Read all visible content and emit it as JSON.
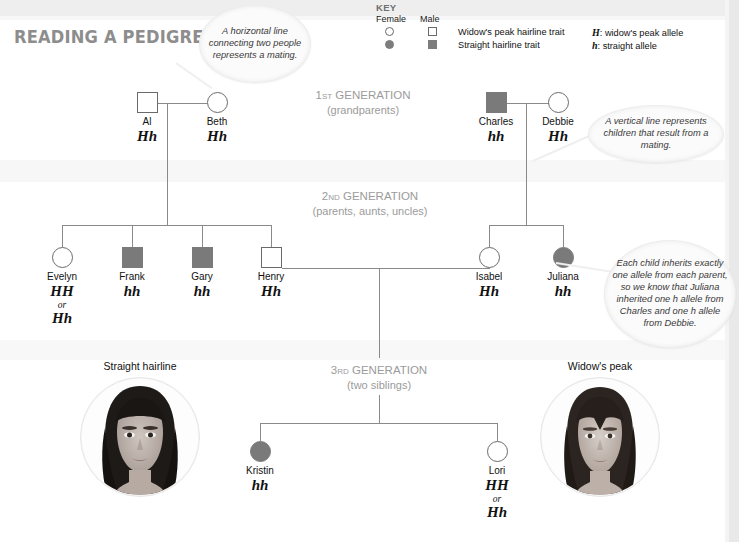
{
  "title": "READING A PEDIGREE",
  "key": {
    "heading": "KEY",
    "col_female": "Female",
    "col_male": "Male",
    "trait_widows_peak": "Widow's peak hairline trait",
    "trait_straight": "Straight hairline trait",
    "allele_H_letter": "H",
    "allele_H_text": ": widow's peak allele",
    "allele_h_letter": "h",
    "allele_h_text": ": straight allele",
    "symbols": {
      "female_open": "open-circle-icon",
      "male_open": "open-square-icon",
      "female_filled": "filled-circle-icon",
      "male_filled": "filled-square-icon"
    }
  },
  "generations": [
    {
      "ordinal": "1",
      "suffix": "ST",
      "word": "GENERATION",
      "sub": "(grandparents)"
    },
    {
      "ordinal": "2",
      "suffix": "ND",
      "word": "GENERATION",
      "sub": "(parents, aunts, uncles)"
    },
    {
      "ordinal": "3",
      "suffix": "RD",
      "word": "GENERATION",
      "sub": "(two siblings)"
    }
  ],
  "people": [
    {
      "id": "al",
      "name": "Al",
      "genotype": "Hh",
      "alt": "",
      "sex": "male",
      "affected": false
    },
    {
      "id": "beth",
      "name": "Beth",
      "genotype": "Hh",
      "alt": "",
      "sex": "female",
      "affected": false
    },
    {
      "id": "charles",
      "name": "Charles",
      "genotype": "hh",
      "alt": "",
      "sex": "male",
      "affected": true
    },
    {
      "id": "debbie",
      "name": "Debbie",
      "genotype": "Hh",
      "alt": "",
      "sex": "female",
      "affected": false
    },
    {
      "id": "evelyn",
      "name": "Evelyn",
      "genotype": "HH",
      "alt": "Hh",
      "or": "or",
      "sex": "female",
      "affected": false
    },
    {
      "id": "frank",
      "name": "Frank",
      "genotype": "hh",
      "alt": "",
      "sex": "male",
      "affected": true
    },
    {
      "id": "gary",
      "name": "Gary",
      "genotype": "hh",
      "alt": "",
      "sex": "male",
      "affected": true
    },
    {
      "id": "henry",
      "name": "Henry",
      "genotype": "Hh",
      "alt": "",
      "sex": "male",
      "affected": false
    },
    {
      "id": "isabel",
      "name": "Isabel",
      "genotype": "Hh",
      "alt": "",
      "sex": "female",
      "affected": false
    },
    {
      "id": "juliana",
      "name": "Juliana",
      "genotype": "hh",
      "alt": "",
      "sex": "female",
      "affected": true
    },
    {
      "id": "kristin",
      "name": "Kristin",
      "genotype": "hh",
      "alt": "",
      "sex": "female",
      "affected": true
    },
    {
      "id": "lori",
      "name": "Lori",
      "genotype": "HH",
      "alt": "Hh",
      "or": "or",
      "sex": "female",
      "affected": false
    }
  ],
  "callouts": [
    {
      "id": "mating",
      "text": "A horizontal line connecting two people represents a mating."
    },
    {
      "id": "children",
      "text": "A vertical line represents children that result from a mating."
    },
    {
      "id": "alleles",
      "text": "Each child inherits exactly one allele from each parent, so we know that Juliana inherited one h allele from Charles and one h allele from Debbie."
    }
  ],
  "photos": [
    {
      "id": "straight",
      "label": "Straight hairline"
    },
    {
      "id": "widows",
      "label": "Widow's peak"
    }
  ],
  "colors": {
    "affected_fill": "#7a7a7a",
    "symbol_stroke": "#6a6a6a",
    "line": "#8a8a8a",
    "gen_label": "#9b9b9b",
    "title": "#8d8d8d"
  }
}
